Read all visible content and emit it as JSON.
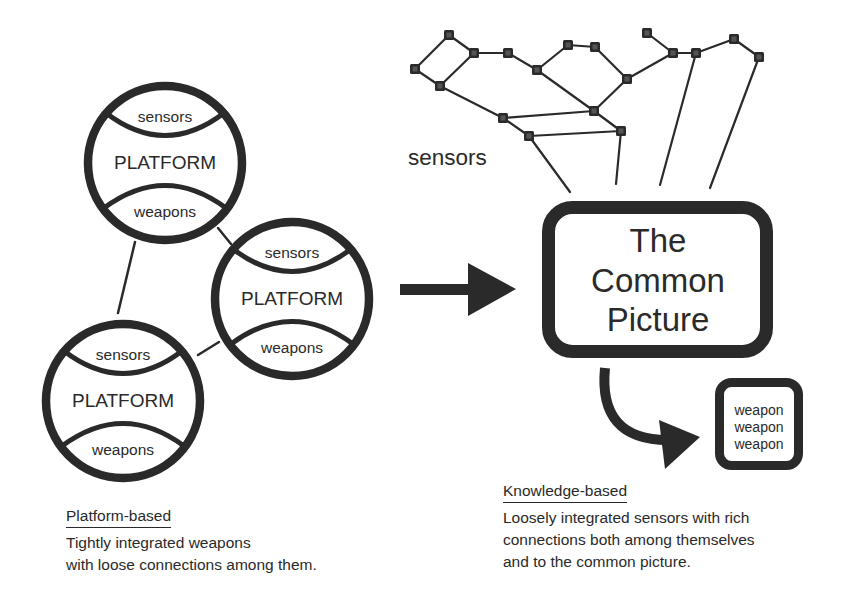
{
  "platform_nodes": [
    {
      "sensors_label": "sensors",
      "platform_label": "PLATFORM",
      "weapons_label": "weapons"
    },
    {
      "sensors_label": "sensors",
      "platform_label": "PLATFORM",
      "weapons_label": "weapons"
    },
    {
      "sensors_label": "sensors",
      "platform_label": "PLATFORM",
      "weapons_label": "weapons"
    }
  ],
  "sensor_network": {
    "label": "sensors",
    "node_count": 18
  },
  "common_picture": {
    "lines": [
      "The",
      "Common",
      "Picture"
    ]
  },
  "weapon_box": {
    "lines": [
      "weapon",
      "weapon",
      "weapon"
    ]
  },
  "captions": {
    "platform": {
      "heading": "Platform-based",
      "body": [
        "Tightly integrated weapons",
        "with loose connections among them."
      ]
    },
    "knowledge": {
      "heading": "Knowledge-based",
      "body": [
        "Loosely integrated sensors with rich",
        "connections both among themselves",
        "and to the common picture."
      ]
    }
  },
  "colors": {
    "ink": "#2a2a2a",
    "background": "#ffffff"
  }
}
